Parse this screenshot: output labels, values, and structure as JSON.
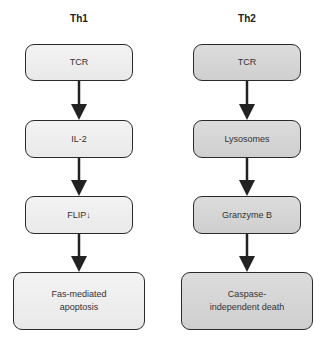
{
  "columns": [
    {
      "title": "Th1",
      "shade": "light",
      "steps": [
        "TCR",
        "IL-2",
        "FLIP↓",
        "Fas-mediated apoptosis"
      ]
    },
    {
      "title": "Th2",
      "shade": "dark",
      "steps": [
        "TCR",
        "Lysosomes",
        "Granzyme B",
        "Caspase-independent death"
      ]
    }
  ],
  "colors": {
    "box_light": "#ececec",
    "box_dark": "#d4d4d4",
    "border": "#2a2a2a",
    "arrow": "#222222"
  }
}
